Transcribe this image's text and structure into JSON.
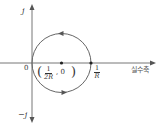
{
  "diagram": {
    "type": "circle-locus-on-complex-plane",
    "colors": {
      "axis": "#777777",
      "circle": "#666666",
      "text": "#333333",
      "point": "#222222"
    },
    "axes": {
      "imag_pos_label": "j",
      "imag_neg_label": "−j",
      "origin_label": "0",
      "real_axis_label": "실수축"
    },
    "circle": {
      "center_label": {
        "open": "(",
        "num": "1",
        "den": "2R",
        "sep": ", 0",
        "close": ")"
      },
      "right_point_label": {
        "num": "1",
        "den": "R"
      },
      "direction": "counter-clockwise arrows at top and bottom"
    }
  }
}
